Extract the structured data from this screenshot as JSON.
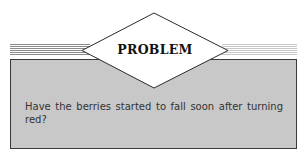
{
  "header": {
    "label": "PROBLEM"
  },
  "problem": {
    "text": "Have the berries started to fall soon after turning red?"
  },
  "colors": {
    "box_fill": "#c8c8c8",
    "box_border": "#3a3a3a",
    "diamond_fill": "#ffffff",
    "stripe_left": "#8a8a8a",
    "stripe_right": "#c8c8c8"
  }
}
